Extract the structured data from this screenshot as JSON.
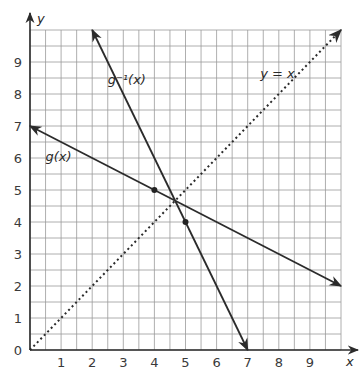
{
  "chart_data": {
    "type": "line",
    "title": "",
    "xlabel": "x",
    "ylabel": "y",
    "xlim": [
      0,
      10
    ],
    "ylim": [
      0,
      10
    ],
    "grid": true,
    "grid_step": 0.5,
    "x_ticks": [
      "1",
      "2",
      "3",
      "4",
      "5",
      "6",
      "7",
      "8",
      "9"
    ],
    "y_ticks": [
      "0",
      "1",
      "2",
      "3",
      "4",
      "5",
      "6",
      "7",
      "8",
      "9"
    ],
    "series": [
      {
        "name": "g(x)",
        "style": "solid",
        "points": [
          [
            0,
            7
          ],
          [
            10,
            2
          ]
        ],
        "label_pos": [
          0.5,
          5.9
        ]
      },
      {
        "name": "g⁻¹(x)",
        "style": "solid",
        "points": [
          [
            2,
            10
          ],
          [
            7,
            0
          ]
        ],
        "label_pos": [
          2.5,
          8.3
        ]
      },
      {
        "name": "y = x",
        "style": "dotted",
        "points": [
          [
            0,
            0
          ],
          [
            10,
            10
          ]
        ],
        "label_pos": [
          7.4,
          8.5
        ]
      }
    ],
    "marked_points": [
      [
        4,
        5
      ],
      [
        5,
        4
      ]
    ],
    "intersection": [
      4.67,
      4.67
    ]
  },
  "labels": {
    "x_axis": "x",
    "y_axis": "y",
    "g": "g(x)",
    "ginv": "g⁻¹(x)",
    "yx": "y = x"
  }
}
